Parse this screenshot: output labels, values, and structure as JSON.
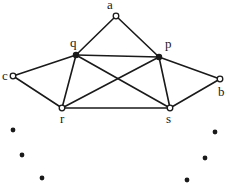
{
  "diagram": {
    "type": "graph",
    "nodes": [
      {
        "id": "a",
        "label": "a",
        "x": 116,
        "y": 16,
        "style": "open",
        "label_x": 107,
        "label_y": 9
      },
      {
        "id": "q",
        "label": "q",
        "x": 76,
        "y": 55,
        "style": "filled",
        "label_x": 70,
        "label_y": 47
      },
      {
        "id": "p",
        "label": "p",
        "x": 159,
        "y": 57,
        "style": "filled",
        "label_x": 165,
        "label_y": 48
      },
      {
        "id": "c",
        "label": "c",
        "x": 13,
        "y": 76,
        "style": "open",
        "label_x": 2,
        "label_y": 80
      },
      {
        "id": "b",
        "label": "b",
        "x": 220,
        "y": 79,
        "style": "open",
        "label_x": 218,
        "label_y": 96
      },
      {
        "id": "r",
        "label": "r",
        "x": 62,
        "y": 108,
        "style": "open",
        "label_x": 60,
        "label_y": 123
      },
      {
        "id": "s",
        "label": "s",
        "x": 170,
        "y": 108,
        "style": "open",
        "label_x": 166,
        "label_y": 123
      }
    ],
    "edges": [
      [
        "a",
        "q"
      ],
      [
        "a",
        "p"
      ],
      [
        "q",
        "p"
      ],
      [
        "q",
        "c"
      ],
      [
        "c",
        "r"
      ],
      [
        "q",
        "r"
      ],
      [
        "q",
        "s"
      ],
      [
        "p",
        "r"
      ],
      [
        "p",
        "s"
      ],
      [
        "p",
        "b"
      ],
      [
        "b",
        "s"
      ],
      [
        "r",
        "s"
      ]
    ],
    "ellipsis_dots": {
      "left": [
        {
          "x": 13,
          "y": 130
        },
        {
          "x": 22,
          "y": 155
        },
        {
          "x": 42,
          "y": 178
        }
      ],
      "right": [
        {
          "x": 215,
          "y": 132
        },
        {
          "x": 205,
          "y": 158
        },
        {
          "x": 187,
          "y": 180
        }
      ]
    },
    "colors": {
      "ink": "#1a1a1a",
      "background": "#ffffff"
    }
  }
}
